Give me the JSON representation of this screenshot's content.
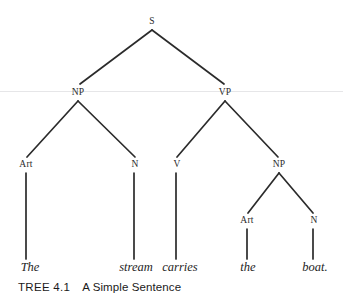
{
  "figure": {
    "kind": "constituency-syntax-tree",
    "sentence": "The stream carries the boat.",
    "caption_tag": "TREE 4.1",
    "caption_title": "A Simple Sentence",
    "ink_color": "#2b2b2b",
    "background_color": "#ffffff"
  },
  "nodes": {
    "s": {
      "label": "S",
      "x": 152,
      "y": 26
    },
    "np_subject": {
      "label": "NP",
      "x": 78,
      "y": 97
    },
    "vp": {
      "label": "VP",
      "x": 225,
      "y": 97
    },
    "art_the_upper": {
      "label": "Art",
      "x": 26,
      "y": 169
    },
    "n_stream": {
      "label": "N",
      "x": 135,
      "y": 169
    },
    "v_carries": {
      "label": "V",
      "x": 177,
      "y": 169
    },
    "np_object": {
      "label": "NP",
      "x": 279,
      "y": 169
    },
    "art_the_lower": {
      "label": "Art",
      "x": 247,
      "y": 225
    },
    "n_boat": {
      "label": "N",
      "x": 314,
      "y": 225
    }
  },
  "terminals": [
    {
      "word": "The",
      "x": 30,
      "y": 275
    },
    {
      "word": "stream",
      "x": 136,
      "y": 275
    },
    {
      "word": "carries",
      "x": 180,
      "y": 275
    },
    {
      "word": "the",
      "x": 248,
      "y": 275
    },
    {
      "word": "boat.",
      "x": 315,
      "y": 275
    }
  ],
  "edges": [
    {
      "name": "s-to-np",
      "x1": 152,
      "y1": 30,
      "x2": 80,
      "y2": 84
    },
    {
      "name": "s-to-vp",
      "x1": 152,
      "y1": 30,
      "x2": 224,
      "y2": 84
    },
    {
      "name": "np-to-art",
      "x1": 78,
      "y1": 101,
      "x2": 27,
      "y2": 157
    },
    {
      "name": "np-to-n",
      "x1": 78,
      "y1": 101,
      "x2": 135,
      "y2": 157
    },
    {
      "name": "vp-to-v",
      "x1": 225,
      "y1": 101,
      "x2": 177,
      "y2": 157
    },
    {
      "name": "vp-to-np",
      "x1": 225,
      "y1": 101,
      "x2": 278,
      "y2": 157
    },
    {
      "name": "npobj-to-art",
      "x1": 279,
      "y1": 173,
      "x2": 248,
      "y2": 213
    },
    {
      "name": "npobj-to-n",
      "x1": 279,
      "y1": 173,
      "x2": 313,
      "y2": 213
    },
    {
      "name": "art-to-the",
      "x1": 26,
      "y1": 173,
      "x2": 26,
      "y2": 259
    },
    {
      "name": "n-to-stream",
      "x1": 134,
      "y1": 173,
      "x2": 134,
      "y2": 259
    },
    {
      "name": "v-to-carries",
      "x1": 176,
      "y1": 173,
      "x2": 176,
      "y2": 259
    },
    {
      "name": "art-to-the-lower",
      "x1": 247,
      "y1": 229,
      "x2": 247,
      "y2": 259
    },
    {
      "name": "n-to-boat",
      "x1": 313,
      "y1": 229,
      "x2": 313,
      "y2": 259
    }
  ],
  "artifacts": {
    "scan_line_y": 91
  }
}
